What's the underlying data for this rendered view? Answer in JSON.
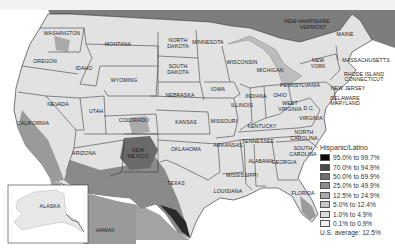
{
  "map": {
    "title": "Hispanic/Latino",
    "type": "choropleth",
    "region": "United States",
    "colors": {
      "ocean": "#bdbdbd",
      "land_base": "#e6e6e6",
      "canada": "#7d7d7d",
      "border": "#222222"
    },
    "state_labels": [
      {
        "name": "WASHINGTON",
        "x": 62,
        "y": 35
      },
      {
        "name": "OREGON",
        "x": 45,
        "y": 63
      },
      {
        "name": "IDAHO",
        "x": 84,
        "y": 70
      },
      {
        "name": "MONTANA",
        "x": 118,
        "y": 46
      },
      {
        "name": "WYOMING",
        "x": 124,
        "y": 82
      },
      {
        "name": "NORTH",
        "x": 178,
        "y": 42
      },
      {
        "name": "DAKOTA",
        "x": 178,
        "y": 48
      },
      {
        "name": "SOUTH",
        "x": 178,
        "y": 68
      },
      {
        "name": "DAKOTA",
        "x": 178,
        "y": 74
      },
      {
        "name": "MINNESOTA",
        "x": 208,
        "y": 44
      },
      {
        "name": "WISCONSIN",
        "x": 242,
        "y": 64
      },
      {
        "name": "MICHIGAN",
        "x": 270,
        "y": 72
      },
      {
        "name": "NEBRASKA",
        "x": 180,
        "y": 97
      },
      {
        "name": "IOWA",
        "x": 218,
        "y": 91
      },
      {
        "name": "ILLINOIS",
        "x": 242,
        "y": 107
      },
      {
        "name": "INDIANA",
        "x": 256,
        "y": 98
      },
      {
        "name": "OHIO",
        "x": 280,
        "y": 97
      },
      {
        "name": "NEVADA",
        "x": 58,
        "y": 106
      },
      {
        "name": "UTAH",
        "x": 96,
        "y": 113
      },
      {
        "name": "COLORADO",
        "x": 134,
        "y": 122
      },
      {
        "name": "KANSAS",
        "x": 186,
        "y": 124
      },
      {
        "name": "MISSOURI",
        "x": 224,
        "y": 123
      },
      {
        "name": "KENTUCKY",
        "x": 262,
        "y": 128
      },
      {
        "name": "WEST",
        "x": 290,
        "y": 105
      },
      {
        "name": "VIRGINIA",
        "x": 290,
        "y": 111
      },
      {
        "name": "VIRGINIA",
        "x": 311,
        "y": 120
      },
      {
        "name": "D.C.",
        "x": 309,
        "y": 110
      },
      {
        "name": "CALIFORNIA",
        "x": 33,
        "y": 125
      },
      {
        "name": "ARIZONA",
        "x": 84,
        "y": 155
      },
      {
        "name": "NEW",
        "x": 138,
        "y": 152
      },
      {
        "name": "MEXICO",
        "x": 138,
        "y": 158
      },
      {
        "name": "OKLAHOMA",
        "x": 186,
        "y": 151
      },
      {
        "name": "ARKANSAS",
        "x": 228,
        "y": 147
      },
      {
        "name": "TENNESSEE",
        "x": 258,
        "y": 143
      },
      {
        "name": "NORTH",
        "x": 304,
        "y": 134
      },
      {
        "name": "CAROLINA",
        "x": 304,
        "y": 140
      },
      {
        "name": "SOUTH",
        "x": 303,
        "y": 150
      },
      {
        "name": "CAROLINA",
        "x": 303,
        "y": 156
      },
      {
        "name": "ALABAMA",
        "x": 261,
        "y": 163
      },
      {
        "name": "GEORGIA",
        "x": 284,
        "y": 164
      },
      {
        "name": "MISSISSIPPI",
        "x": 242,
        "y": 177
      },
      {
        "name": "TEXAS",
        "x": 176,
        "y": 185
      },
      {
        "name": "LOUISIANA",
        "x": 228,
        "y": 193
      },
      {
        "name": "FLORIDA",
        "x": 303,
        "y": 195
      },
      {
        "name": "ALASKA",
        "x": 50,
        "y": 208
      },
      {
        "name": "HAWAII",
        "x": 105,
        "y": 232
      },
      {
        "name": "NEW-HAMPSHIRE",
        "x": 307,
        "y": 23
      },
      {
        "name": "VERMONT",
        "x": 313,
        "y": 29
      },
      {
        "name": "MAINE",
        "x": 345,
        "y": 36
      },
      {
        "name": "NEW",
        "x": 318,
        "y": 62
      },
      {
        "name": "YORK",
        "x": 318,
        "y": 68
      },
      {
        "name": "MASSACHUSETTS",
        "x": 366,
        "y": 62
      },
      {
        "name": "RHODE ISLAND",
        "x": 364,
        "y": 76
      },
      {
        "name": "CONNECTICUT",
        "x": 364,
        "y": 81
      },
      {
        "name": "PENNSYLVANIA",
        "x": 300,
        "y": 87
      },
      {
        "name": "NEW JERSEY",
        "x": 348,
        "y": 90
      },
      {
        "name": "DELAWARE",
        "x": 345,
        "y": 100
      },
      {
        "name": "MARYLAND",
        "x": 345,
        "y": 105
      }
    ],
    "legend": {
      "title": "Hispanic/Latino",
      "items": [
        {
          "label": "95.0% to 99.7%",
          "color": "#0a0a0a"
        },
        {
          "label": "70.0% to 94.9%",
          "color": "#4a4a4a"
        },
        {
          "label": "50.0% to 69.9%",
          "color": "#6e6e6e"
        },
        {
          "label": "25.0% to 49.9%",
          "color": "#8e8e8e"
        },
        {
          "label": "12.5% to 24.9%",
          "color": "#ababab"
        },
        {
          "label": "5.0% to 12.4%",
          "color": "#c6c6c6"
        },
        {
          "label": "1.0% to 4.9%",
          "color": "#dcdcdc"
        },
        {
          "label": "0.1% to 0.9%",
          "color": "#f2f2f2"
        }
      ],
      "note": "U.S. average:  12.5%"
    }
  }
}
